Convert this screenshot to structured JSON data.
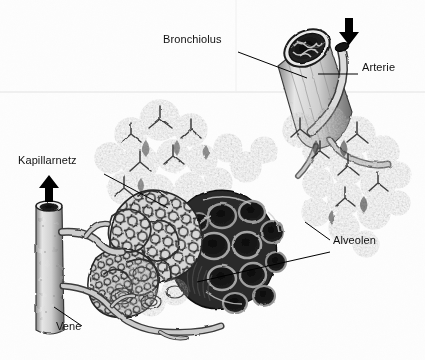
{
  "figure": {
    "style": "halftone-engraving",
    "background_color": "#fdfdfd",
    "ink_color": "#1a1a1a"
  },
  "labels": [
    {
      "id": "bronchiolus",
      "text": "Bronchiolus",
      "x": 163,
      "y": 40,
      "leader_from": [
        238,
        52
      ],
      "leader_to": [
        307,
        78
      ],
      "arrow": false
    },
    {
      "id": "arterie",
      "text": "Arterie",
      "x": 362,
      "y": 68,
      "leader_from": [
        358,
        74
      ],
      "leader_to": [
        318,
        74
      ],
      "arrow": false
    },
    {
      "id": "kapillarnetz",
      "text": "Kapillarnetz",
      "x": 18,
      "y": 161,
      "leader_from": [
        104,
        174
      ],
      "leader_to": [
        168,
        208
      ],
      "arrow": false
    },
    {
      "id": "alveolen",
      "text": "Alveolen",
      "x": 333,
      "y": 241,
      "leader_from": [
        330,
        240
      ],
      "leader_to": [
        305,
        222
      ],
      "arrow": false
    },
    {
      "id": "alveolen-2",
      "text": "",
      "x": 0,
      "y": 0,
      "leader_from": [
        330,
        252
      ],
      "leader_to": [
        197,
        282
      ],
      "arrow": false
    },
    {
      "id": "vene",
      "text": "Vene",
      "x": 56,
      "y": 327,
      "leader_from": [
        82,
        326
      ],
      "leader_to": [
        54,
        307
      ],
      "arrow": false
    }
  ],
  "pointer_arrows": [
    {
      "id": "arterie-arrow",
      "x": 348,
      "y": 30,
      "direction": "down",
      "note": "schwarzer Pfeil auf die Arterie"
    },
    {
      "id": "vene-arrow",
      "x": 48,
      "y": 190,
      "direction": "up",
      "note": "schwarzer Pfeil auf die Vene"
    }
  ],
  "structures": [
    {
      "id": "bronchiolus-tube",
      "name": "Bronchiolus",
      "note": "angeschnittene Roehre mit dunklem Lumen und gefaltetem Epithel"
    },
    {
      "id": "arteriole",
      "name": "Arterie",
      "note": "duennes Gefaess neben dem Bronchiolus, angeschnitten"
    },
    {
      "id": "vein-trunk",
      "name": "Vene",
      "note": "dicker senkrechter Gefaessstamm links mit hohlem Anschnitt"
    },
    {
      "id": "capillary-net",
      "name": "Kapillarnetz",
      "note": "dichtes Maschenwerk um die Alveolen"
    },
    {
      "id": "alveolar-sacs",
      "name": "Alveolen",
      "note": "traubenfoermige Blaeschen, teils aufgeschnitten"
    },
    {
      "id": "cut-alveoli",
      "name": "Aufgeschnittene Alveolen",
      "note": "dunkle Hohlraeume mit dicken Septen"
    }
  ]
}
